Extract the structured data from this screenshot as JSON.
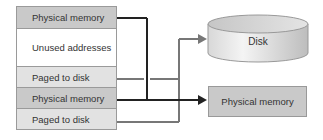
{
  "address_space": {
    "rows": [
      {
        "label": "Physical memory",
        "type": "phys",
        "height": 23
      },
      {
        "label": "Unused addresses",
        "type": "unused",
        "height": 39
      },
      {
        "label": "Paged to disk",
        "type": "paged",
        "height": 22
      },
      {
        "label": "Physical memory",
        "type": "phys",
        "height": 22
      },
      {
        "label": "Paged to disk",
        "type": "paged",
        "height": 22
      }
    ]
  },
  "targets": {
    "disk_label": "Disk",
    "physical_memory_label": "Physical memory"
  },
  "colors": {
    "phys_wire": "#222222",
    "disk_wire": "#777777",
    "phys_fill": "#c9c9c9",
    "paged_fill": "#e2e2e2"
  }
}
